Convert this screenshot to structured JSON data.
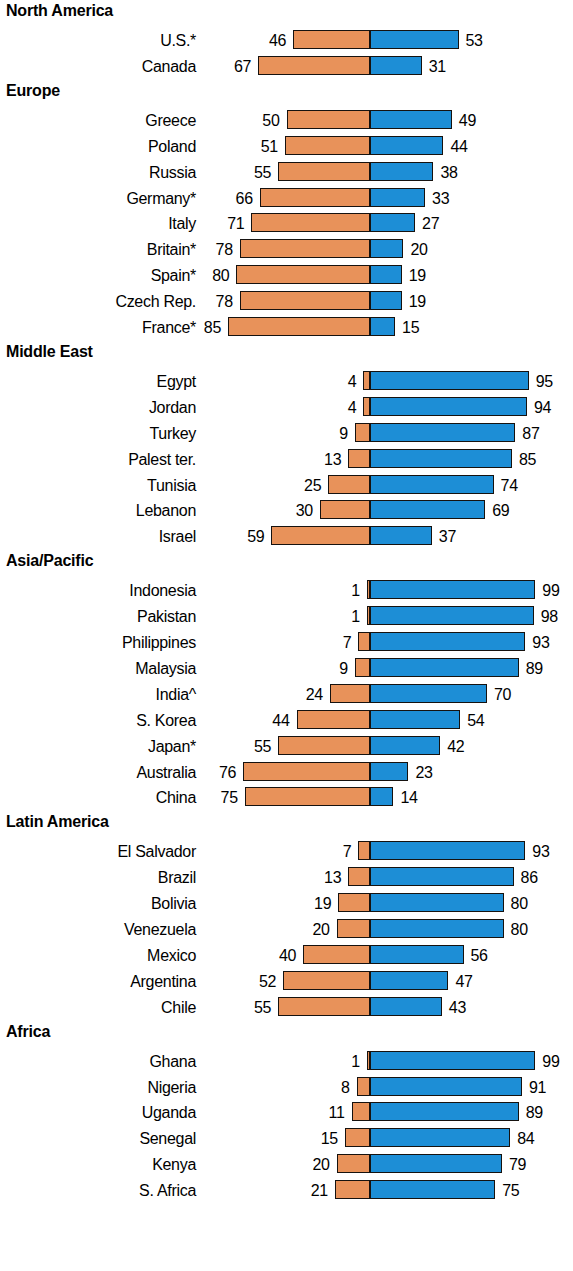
{
  "chart_data": {
    "type": "bar",
    "subtype": "diverging-stacked-bar",
    "title": "",
    "xlabel": "",
    "ylabel": "",
    "axis_center_value": 0,
    "grid": false,
    "legend_position": "none",
    "series": [
      {
        "name": "left",
        "color": "#e8925a",
        "direction": "left"
      },
      {
        "name": "right",
        "color": "#1d8ed6",
        "direction": "right"
      }
    ],
    "units": "percent",
    "scale_px_per_unit": 1.67,
    "groups": [
      {
        "name": "North America",
        "rows": [
          {
            "label": "U.S.*",
            "left": 46,
            "right": 53
          },
          {
            "label": "Canada",
            "left": 67,
            "right": 31
          }
        ]
      },
      {
        "name": "Europe",
        "rows": [
          {
            "label": "Greece",
            "left": 50,
            "right": 49
          },
          {
            "label": "Poland",
            "left": 51,
            "right": 44
          },
          {
            "label": "Russia",
            "left": 55,
            "right": 38
          },
          {
            "label": "Germany*",
            "left": 66,
            "right": 33
          },
          {
            "label": "Italy",
            "left": 71,
            "right": 27
          },
          {
            "label": "Britain*",
            "left": 78,
            "right": 20
          },
          {
            "label": "Spain*",
            "left": 80,
            "right": 19
          },
          {
            "label": "Czech Rep.",
            "left": 78,
            "right": 19
          },
          {
            "label": "France*",
            "left": 85,
            "right": 15
          }
        ]
      },
      {
        "name": "Middle East",
        "rows": [
          {
            "label": "Egypt",
            "left": 4,
            "right": 95
          },
          {
            "label": "Jordan",
            "left": 4,
            "right": 94
          },
          {
            "label": "Turkey",
            "left": 9,
            "right": 87
          },
          {
            "label": "Palest ter.",
            "left": 13,
            "right": 85
          },
          {
            "label": "Tunisia",
            "left": 25,
            "right": 74
          },
          {
            "label": "Lebanon",
            "left": 30,
            "right": 69
          },
          {
            "label": "Israel",
            "left": 59,
            "right": 37
          }
        ]
      },
      {
        "name": "Asia/Pacific",
        "rows": [
          {
            "label": "Indonesia",
            "left": 1,
            "right": 99
          },
          {
            "label": "Pakistan",
            "left": 1,
            "right": 98
          },
          {
            "label": "Philippines",
            "left": 7,
            "right": 93
          },
          {
            "label": "Malaysia",
            "left": 9,
            "right": 89
          },
          {
            "label": "India^",
            "left": 24,
            "right": 70
          },
          {
            "label": "S. Korea",
            "left": 44,
            "right": 54
          },
          {
            "label": "Japan*",
            "left": 55,
            "right": 42
          },
          {
            "label": "Australia",
            "left": 76,
            "right": 23
          },
          {
            "label": "China",
            "left": 75,
            "right": 14
          }
        ]
      },
      {
        "name": "Latin America",
        "rows": [
          {
            "label": "El Salvador",
            "left": 7,
            "right": 93
          },
          {
            "label": "Brazil",
            "left": 13,
            "right": 86
          },
          {
            "label": "Bolivia",
            "left": 19,
            "right": 80
          },
          {
            "label": "Venezuela",
            "left": 20,
            "right": 80
          },
          {
            "label": "Mexico",
            "left": 40,
            "right": 56
          },
          {
            "label": "Argentina",
            "left": 52,
            "right": 47
          },
          {
            "label": "Chile",
            "left": 55,
            "right": 43
          }
        ]
      },
      {
        "name": "Africa",
        "rows": [
          {
            "label": "Ghana",
            "left": 1,
            "right": 99
          },
          {
            "label": "Nigeria",
            "left": 8,
            "right": 91
          },
          {
            "label": "Uganda",
            "left": 11,
            "right": 89
          },
          {
            "label": "Senegal",
            "left": 15,
            "right": 84
          },
          {
            "label": "Kenya",
            "left": 20,
            "right": 79
          },
          {
            "label": "S. Africa",
            "left": 21,
            "right": 75
          }
        ]
      }
    ]
  }
}
